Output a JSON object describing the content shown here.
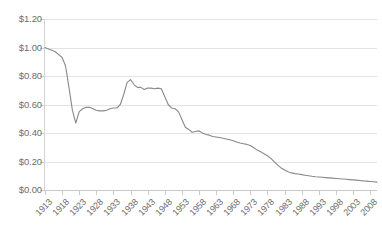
{
  "chart_data": {
    "type": "line",
    "title": "",
    "subtitle": "",
    "xlabel": "",
    "ylabel": "",
    "ylim": [
      0.0,
      1.2
    ],
    "xlim": [
      1913,
      2010
    ],
    "ytick_step": 0.2,
    "ytick_format": "$0.00",
    "grid": true,
    "grid_axis": "y",
    "legend": false,
    "legend_position": "none",
    "y_tick_labels": [
      "$0.00",
      "$0.20",
      "$0.40",
      "$0.60",
      "$0.80",
      "$1.00",
      "$1.20"
    ],
    "y_tick_values": [
      0.0,
      0.2,
      0.4,
      0.6,
      0.8,
      1.0,
      1.2
    ],
    "x_tick_labels": [
      "1913",
      "1918",
      "1923",
      "1928",
      "1933",
      "1938",
      "1943",
      "1948",
      "1953",
      "1958",
      "1963",
      "1968",
      "1973",
      "1978",
      "1983",
      "1988",
      "1993",
      "1998",
      "2003",
      "2008"
    ],
    "x_tick_values": [
      1913,
      1918,
      1923,
      1928,
      1933,
      1938,
      1943,
      1948,
      1953,
      1958,
      1963,
      1968,
      1973,
      1978,
      1983,
      1988,
      1993,
      1998,
      2003,
      2008
    ],
    "x_tick_rotation": -45,
    "series": [
      {
        "name": "Purchasing power of the US dollar",
        "color": "#898989",
        "x": [
          1913,
          1914,
          1915,
          1916,
          1917,
          1918,
          1919,
          1920,
          1921,
          1922,
          1923,
          1924,
          1925,
          1926,
          1927,
          1928,
          1929,
          1930,
          1931,
          1932,
          1933,
          1934,
          1935,
          1936,
          1937,
          1938,
          1939,
          1940,
          1941,
          1942,
          1943,
          1944,
          1945,
          1946,
          1947,
          1948,
          1949,
          1950,
          1951,
          1952,
          1953,
          1954,
          1955,
          1956,
          1957,
          1958,
          1959,
          1960,
          1961,
          1962,
          1963,
          1964,
          1965,
          1966,
          1967,
          1968,
          1969,
          1970,
          1971,
          1972,
          1973,
          1974,
          1975,
          1976,
          1977,
          1978,
          1979,
          1980,
          1981,
          1982,
          1983,
          1984,
          1985,
          1986,
          1987,
          1988,
          1989,
          1990,
          1991,
          1992,
          1993,
          1994,
          1995,
          1996,
          1997,
          1998,
          1999,
          2000,
          2001,
          2002,
          2003,
          2004,
          2005,
          2006,
          2007,
          2008,
          2009,
          2010
        ],
        "y": [
          1.0,
          0.99,
          0.98,
          0.97,
          0.95,
          0.93,
          0.87,
          0.72,
          0.56,
          0.47,
          0.55,
          0.57,
          0.58,
          0.58,
          0.57,
          0.56,
          0.555,
          0.555,
          0.56,
          0.57,
          0.575,
          0.575,
          0.6,
          0.67,
          0.755,
          0.775,
          0.74,
          0.72,
          0.72,
          0.705,
          0.715,
          0.715,
          0.71,
          0.715,
          0.71,
          0.655,
          0.6,
          0.575,
          0.57,
          0.55,
          0.495,
          0.44,
          0.425,
          0.405,
          0.41,
          0.415,
          0.4,
          0.39,
          0.385,
          0.375,
          0.372,
          0.368,
          0.363,
          0.358,
          0.352,
          0.345,
          0.337,
          0.33,
          0.325,
          0.32,
          0.312,
          0.296,
          0.28,
          0.268,
          0.255,
          0.24,
          0.222,
          0.198,
          0.175,
          0.155,
          0.14,
          0.128,
          0.12,
          0.115,
          0.112,
          0.108,
          0.104,
          0.1,
          0.096,
          0.093,
          0.091,
          0.089,
          0.087,
          0.085,
          0.083,
          0.081,
          0.079,
          0.077,
          0.075,
          0.073,
          0.071,
          0.069,
          0.067,
          0.064,
          0.062,
          0.06,
          0.058,
          0.055
        ]
      }
    ]
  },
  "axis": {
    "y_labels": [
      "$1.20",
      "$1.00",
      "$0.80",
      "$0.60",
      "$0.40",
      "$0.20",
      "$0.00"
    ],
    "x_labels": [
      "1913",
      "1918",
      "1923",
      "1928",
      "1933",
      "1938",
      "1943",
      "1948",
      "1953",
      "1958",
      "1963",
      "1968",
      "1973",
      "1978",
      "1983",
      "1988",
      "1993",
      "1998",
      "2003",
      "2008"
    ]
  },
  "style": {
    "line_color": "#898989",
    "grid_color": "#e3e3e3",
    "axis_color": "#c9c9c9",
    "text_color": "#6e6e6e",
    "background": "#ffffff"
  }
}
